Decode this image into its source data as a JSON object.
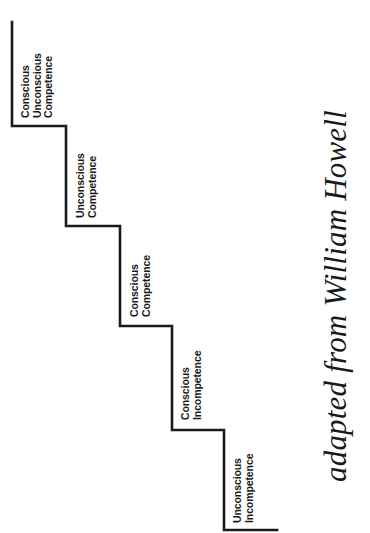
{
  "diagram": {
    "type": "staircase",
    "steps": [
      {
        "level": 1,
        "lines": [
          "Unconscious",
          "Incompetence"
        ]
      },
      {
        "level": 2,
        "lines": [
          "Conscious",
          "Incompetence"
        ]
      },
      {
        "level": 3,
        "lines": [
          "Conscious",
          "Competence"
        ]
      },
      {
        "level": 4,
        "lines": [
          "Unconscious",
          "Competence"
        ]
      },
      {
        "level": 5,
        "lines": [
          "Conscious",
          "Unconscious",
          "Competence"
        ]
      }
    ],
    "credit": "adapted from William Howell",
    "colors": {
      "line": "#1a1a1a",
      "text": "#1a1a1a",
      "background": "#ffffff"
    }
  }
}
